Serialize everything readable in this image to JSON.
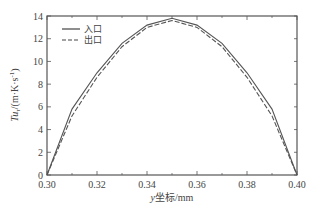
{
  "chart_data": {
    "type": "line",
    "title": "",
    "xlabel": "y坐标/mm",
    "ylabel": "Tuτ/(m·K·s⁻¹)",
    "xlim": [
      0.3,
      0.4
    ],
    "ylim": [
      0,
      14
    ],
    "xticks": [
      0.3,
      0.32,
      0.34,
      0.36,
      0.38,
      0.4
    ],
    "xtick_labels": [
      "0.30",
      "0.32",
      "0.34",
      "0.36",
      "0.38",
      "0.40"
    ],
    "yticks": [
      0,
      2,
      4,
      6,
      8,
      10,
      12,
      14
    ],
    "ytick_labels": [
      "0",
      "2",
      "4",
      "6",
      "8",
      "10",
      "12",
      "14"
    ],
    "grid": false,
    "legend_position": "upper left",
    "x": [
      0.3,
      0.31,
      0.32,
      0.33,
      0.34,
      0.35,
      0.36,
      0.37,
      0.38,
      0.39,
      0.4
    ],
    "series": [
      {
        "name": "入口",
        "style": "solid",
        "color": "#555555",
        "values": [
          0,
          5.8,
          9.0,
          11.6,
          13.2,
          13.8,
          13.2,
          11.6,
          9.0,
          5.8,
          0
        ]
      },
      {
        "name": "出口",
        "style": "dashed",
        "color": "#555555",
        "values": [
          0,
          5.2,
          8.6,
          11.3,
          13.0,
          13.6,
          13.0,
          11.3,
          8.6,
          5.2,
          0
        ]
      }
    ]
  },
  "labels": {
    "xlabel_italic": "y",
    "xlabel_rest": "坐标/mm",
    "ylabel_main": "Tu",
    "ylabel_sub": "τ",
    "ylabel_rest": "/(m·K·s",
    "ylabel_sup": "-1",
    "ylabel_close": ")"
  }
}
